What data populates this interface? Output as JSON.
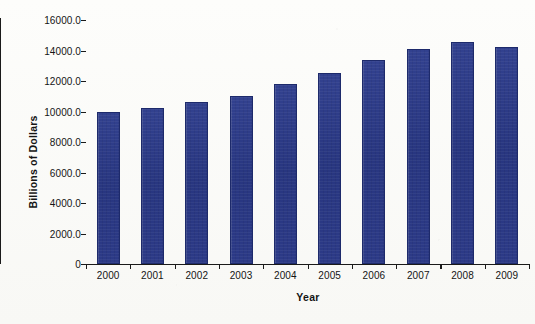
{
  "chart_data": {
    "type": "bar",
    "title": "",
    "xlabel": "Year",
    "ylabel": "Billions of Dollars",
    "categories": [
      "2000",
      "2001",
      "2002",
      "2003",
      "2004",
      "2005",
      "2006",
      "2007",
      "2008",
      "2009"
    ],
    "values": [
      9950,
      10250,
      10600,
      11050,
      11800,
      12550,
      13350,
      14100,
      14550,
      14250
    ],
    "series": [
      {
        "name": "Billions of Dollars",
        "values": [
          9950,
          10250,
          10600,
          11050,
          11800,
          12550,
          13350,
          14100,
          14550,
          14250
        ]
      }
    ],
    "ylim": [
      0,
      16000
    ],
    "ytick_values": [
      0,
      2000,
      4000,
      6000,
      8000,
      10000,
      12000,
      14000,
      16000
    ],
    "ytick_labels": [
      "0",
      "2000.0",
      "4000.0",
      "6000.0",
      "8000.0",
      "10000.0",
      "12000.0",
      "14000.0",
      "16000.0"
    ],
    "grid": false,
    "legend": "none",
    "bar_color": "#2b3a8c",
    "axis_color": "#1a1a1a",
    "background_color": "#fbfbf9"
  }
}
